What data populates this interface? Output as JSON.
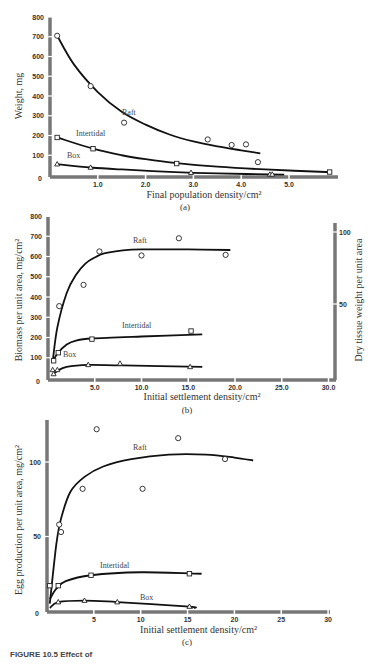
{
  "caption": "FIGURE 10.5 Effect of",
  "chart_data": [
    {
      "id": "a",
      "type": "scatter",
      "panel_label": "(a)",
      "xlabel": "Final population density/cm²",
      "ylabel": "Weight, mg",
      "xlim": [
        0,
        5.8
      ],
      "ylim": [
        0,
        800
      ],
      "xticks": [
        "1.0",
        "2.0",
        "3.0",
        "4.0",
        "5.0"
      ],
      "yticks": [
        "100",
        "200",
        "300",
        "400",
        "500",
        "600",
        "700",
        "800"
      ],
      "y0_label": "0",
      "series": [
        {
          "name": "Raft",
          "marker": "circle",
          "points": [
            [
              0.15,
              705
            ],
            [
              0.85,
              450
            ],
            [
              1.55,
              265
            ],
            [
              3.3,
              180
            ],
            [
              3.8,
              152
            ],
            [
              4.1,
              155
            ],
            [
              4.35,
              65
            ]
          ],
          "curve": [
            [
              0.15,
              705
            ],
            [
              0.5,
              560
            ],
            [
              1.0,
              420
            ],
            [
              1.5,
              320
            ],
            [
              2.0,
              255
            ],
            [
              2.5,
              205
            ],
            [
              3.0,
              170
            ],
            [
              3.5,
              145
            ],
            [
              4.0,
              125
            ],
            [
              4.4,
              110
            ]
          ]
        },
        {
          "name": "Intertidal",
          "marker": "square",
          "points": [
            [
              0.15,
              190
            ],
            [
              0.9,
              133
            ],
            [
              2.65,
              58
            ],
            [
              5.85,
              15
            ]
          ],
          "curve": [
            [
              0.15,
              190
            ],
            [
              0.9,
              133
            ],
            [
              1.5,
              100
            ],
            [
              2.0,
              80
            ],
            [
              2.65,
              60
            ],
            [
              3.5,
              42
            ],
            [
              4.5,
              28
            ],
            [
              5.9,
              14
            ]
          ]
        },
        {
          "name": "Box",
          "marker": "triangle",
          "points": [
            [
              0.15,
              55
            ],
            [
              0.85,
              38
            ],
            [
              2.95,
              12
            ],
            [
              4.6,
              3
            ],
            [
              4.65,
              3
            ]
          ],
          "curve": [
            [
              0.15,
              55
            ],
            [
              0.85,
              38
            ],
            [
              1.5,
              28
            ],
            [
              2.5,
              16
            ],
            [
              3.5,
              8
            ],
            [
              4.9,
              2
            ]
          ]
        }
      ]
    },
    {
      "id": "b",
      "type": "scatter",
      "panel_label": "(b)",
      "xlabel": "Initial settlement density/cm²",
      "ylabel": "Biomass per unit area, mg/cm²",
      "ylabel_right": "Dry tissue weight per unit area",
      "xlim": [
        0,
        30
      ],
      "ylim": [
        0,
        800
      ],
      "xticks": [
        "5.0",
        "10.0",
        "15.0",
        "20.0",
        "25.0",
        "30.0"
      ],
      "yticks": [
        "100",
        "200",
        "300",
        "400",
        "500",
        "600",
        "700",
        "800"
      ],
      "yticks_right": [
        "50",
        "100"
      ],
      "y0_label": "0",
      "series": [
        {
          "name": "Raft",
          "marker": "circle",
          "points": [
            [
              1.2,
              355
            ],
            [
              3.8,
              460
            ],
            [
              5.5,
              625
            ],
            [
              10,
              605
            ],
            [
              14,
              690
            ],
            [
              19,
              608
            ]
          ],
          "curve": [
            [
              0.5,
              80
            ],
            [
              1,
              250
            ],
            [
              2,
              420
            ],
            [
              3,
              510
            ],
            [
              4,
              565
            ],
            [
              5,
              595
            ],
            [
              6,
              615
            ],
            [
              8,
              630
            ],
            [
              10,
              635
            ],
            [
              15,
              635
            ],
            [
              19.5,
              632
            ]
          ]
        },
        {
          "name": "Intertidal",
          "marker": "square",
          "points": [
            [
              0.6,
              85
            ],
            [
              1.1,
              125
            ],
            [
              4.7,
              192
            ],
            [
              15.3,
              232
            ]
          ],
          "curve": [
            [
              0.5,
              80
            ],
            [
              1,
              120
            ],
            [
              2,
              165
            ],
            [
              3,
              185
            ],
            [
              4.7,
              195
            ],
            [
              10,
              205
            ],
            [
              16.5,
              215
            ]
          ]
        },
        {
          "name": "Box",
          "marker": "triangle",
          "points": [
            [
              0.5,
              40
            ],
            [
              0.6,
              20
            ],
            [
              1.0,
              40
            ],
            [
              4.3,
              65
            ],
            [
              7.7,
              72
            ],
            [
              15.2,
              55
            ]
          ],
          "curve": [
            [
              0.5,
              15
            ],
            [
              1,
              35
            ],
            [
              2,
              55
            ],
            [
              4.3,
              65
            ],
            [
              8,
              62
            ],
            [
              16.5,
              55
            ]
          ]
        }
      ]
    },
    {
      "id": "c",
      "type": "scatter",
      "panel_label": "(c)",
      "xlabel": "Initial settlement density/cm²",
      "ylabel": "Egg production per unit area, mg/cm²",
      "xlim": [
        0,
        30
      ],
      "ylim": [
        0,
        125
      ],
      "xticks": [
        "5",
        "10",
        "15",
        "20",
        "25",
        "30"
      ],
      "yticks": [
        "50",
        "100"
      ],
      "y0_label": "0",
      "series": [
        {
          "name": "Raft",
          "marker": "circle",
          "points": [
            [
              5.3,
              122
            ],
            [
              3.8,
              82
            ],
            [
              1.3,
              58
            ],
            [
              1.5,
              53
            ],
            [
              10.2,
              82
            ],
            [
              14,
              116
            ],
            [
              19,
              102
            ]
          ],
          "curve": [
            [
              0.3,
              5
            ],
            [
              1,
              45
            ],
            [
              1.5,
              62
            ],
            [
              2.5,
              80
            ],
            [
              4,
              90
            ],
            [
              6,
              97
            ],
            [
              9,
              102
            ],
            [
              13,
              105
            ],
            [
              17,
              105
            ],
            [
              20,
              103
            ],
            [
              22,
              101
            ]
          ]
        },
        {
          "name": "Intertidal",
          "marker": "square",
          "points": [
            [
              0.3,
              17
            ],
            [
              1.2,
              17
            ],
            [
              4.7,
              24
            ],
            [
              15.2,
              25
            ]
          ],
          "curve": [
            [
              0.3,
              8
            ],
            [
              1,
              15
            ],
            [
              2,
              20
            ],
            [
              4.7,
              24
            ],
            [
              10,
              26
            ],
            [
              16.5,
              25
            ]
          ]
        },
        {
          "name": "Box",
          "marker": "triangle",
          "points": [
            [
              1.2,
              6
            ],
            [
              4,
              7
            ],
            [
              7.5,
              6
            ],
            [
              15.2,
              3
            ]
          ],
          "curve": [
            [
              0.3,
              2
            ],
            [
              1.2,
              6
            ],
            [
              4,
              7
            ],
            [
              7.5,
              6
            ],
            [
              15.2,
              3
            ],
            [
              15.6,
              2
            ]
          ]
        }
      ]
    }
  ]
}
